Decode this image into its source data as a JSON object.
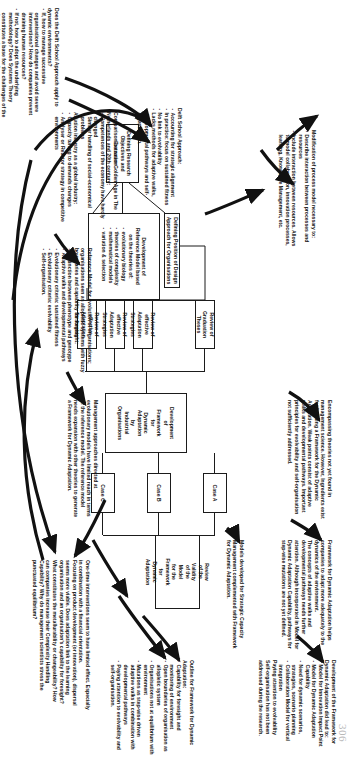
{
  "page": {
    "number": "306"
  },
  "diagram": {
    "boxes": [
      {
        "id": "objectives",
        "label": "Defining Research\nObjectives and Execution"
      },
      {
        "id": "reference_model",
        "label": "Development of\nReference Model based\non the theories of:",
        "bullets": [
          "evolutionary biology",
          "theories of complexity",
          "mathematical models",
          "variation & selection"
        ]
      },
      {
        "id": "design_approach",
        "label": "Defining Position of Design\nApproach for Organisations"
      },
      {
        "id": "grad_theses",
        "label": "Review of Graduation\nTheses"
      },
      {
        "id": "adapt1",
        "label": "Review of effective\nAdaptation Strategies"
      },
      {
        "id": "adapt2",
        "label": "Review of effective\nAdaptation Strategies"
      },
      {
        "id": "adapt3",
        "label": "Review of effective\nAdaptation Strategies"
      },
      {
        "id": "framework_dev",
        "label": "Development\nof\nFramework\nfor\nDynamic\nAdaptation\nby\nIndustrial\nOrganisations"
      },
      {
        "id": "case_a",
        "label": "Case A"
      },
      {
        "id": "case_b",
        "label": "Case B"
      },
      {
        "id": "case_c",
        "label": "Case C"
      },
      {
        "id": "review_validity",
        "label": "Review\nof the\nValidity\nof the\nModel\nfor the\nFramework\nfor\nDynamic\nAdaptation"
      }
    ],
    "notes": [
      {
        "id": "note_delft_questions",
        "text": "Does the Delft School Approach apply to dynamic environments?",
        "bullets": [
          "If, how to manage successive organisational changes and avoid severe interventions? How do companies prevent draining human resources?",
          "If not, how to adopt the underlying methodology? Does Systems Theory constitutes a base for the challenges of the dynamic environment?"
        ]
      },
      {
        "id": "note_delft_school",
        "text": "Delft School Approach:",
        "bullets": [
          "Accounting for strategic alignment",
          "In practice: focus on sustained fitness",
          "No link to evolvability",
          "Lacks methods for adaptive walks, developmental pathways and self-organisation."
        ]
      },
      {
        "id": "note_process_model",
        "text": "Modification of process model necessary to:",
        "bullets": [
          "Describe interaction between processes and resources",
          "Include interaction between resources. Allows to model collaboration, innovation processes, learning, Knowledge Management, etc."
        ]
      },
      {
        "id": "note_framework_helps",
        "text": "Framework for Dynamic Adaptation helps companies to adapt more adequately to the dynamics of the environment.\nThe concepts of adaptive walks and developmental pathways needs further attention. Although incorporated in Model for Dynamic Adaptation Capability, pathways for step-wise mutations are not yet defined."
      },
      {
        "id": "note_models_developed",
        "text": "Models developed for Strategic Capacity Management complemented with Framework for Dynamic Adaptation."
      },
      {
        "id": "note_framework_dev",
        "text": "Development of the Framework for Dynamic Adaptation did lead to:",
        "bullets": [
          "Model for Innovation Impact Point",
          "Model for Dynamic Adaptation Capability",
          "Need for dynamic scenarios, strategies, scenario planning",
          "Collaboration Model for vertical integration"
        ],
        "tail": "Paying attention to evolvability\nSelf-organisation has not been addressed during the research."
      },
      {
        "id": "note_outline",
        "text": "Outline for Framework for Dynamic Adaptation:",
        "bullets": [
          "Capability for foresight and monitoring of environment",
          "Open boundaries of organisation as allopletic system",
          "Organisations not at equilibrium with environment",
          "Mutations as step-wise driven adaptive walks in combination with developmental pathways",
          "Paying attention to evolvability and self-organisation."
        ]
      },
      {
        "id": "note_encompassing",
        "text": "Encompassing theories not yet found in management science. However, Ingredients exist for building a Framework for the Dynamic Adaptation. Weak points consist of adaptive walks and developmental pathways. Important principles for evolvability and self-organisation not sufficiently addressed."
      },
      {
        "id": "note_management_approaches",
        "text": "Management approaches directed at evolutionary models have limited reach in terms of the reference model. The reference model needs expansion with other theories to generate a Framework for Dynamic Adaptation."
      },
      {
        "id": "note_reference_model",
        "text": "Reference Model for evolution of organisations; organisations seen as allopletic systems with fuzzy boundaries and capability for foresight:",
        "bullets": [
          "Distinction between phenotype and genotype",
          "Adaptive walks and developmental pathways",
          "Evolutionary criteria: sustained fitness",
          "Evolutionary criteria: evolvability",
          "Self-organisation."
        ]
      },
      {
        "id": "note_golden_age",
        "text": "Comparison between Golden Age in The Netherlands and 20th century:",
        "bullets": [
          "Competences of the economy have hardly changed",
          "Similar handling of social-economical problems"
        ],
        "sub_title": "Aviation industry as a global industry:",
        "sub_bullets": [
          "Capacity tuning to demands changes",
          "Analyser or Reactor strategy in competitive environments"
        ]
      },
      {
        "id": "note_onetime",
        "text": "One-time interventions seem to have limited effect. Especially in combination with a financial orientation.\nFocusing on product development (or innovation), dispersal seems more viable. Does adaptation link to the learning organisation and an organisation's capability for foresight? What constitutes the metallurability or changeability? How can companies increase their Complexity Handling Capability? Why do management scientists stress the punctuated equilibrium?"
      }
    ]
  }
}
